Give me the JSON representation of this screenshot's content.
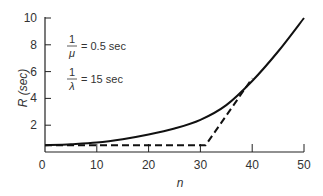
{
  "chart_data": {
    "type": "line",
    "title": "",
    "xlabel": "n",
    "ylabel": "R (sec)",
    "xlim": [
      0,
      50
    ],
    "ylim": [
      0,
      10
    ],
    "x_ticks": [
      "0",
      "10",
      "20",
      "30",
      "40",
      "50"
    ],
    "y_ticks": [
      "2",
      "4",
      "6",
      "8",
      "10"
    ],
    "grid": false,
    "legend": "none",
    "annotations": [
      {
        "num": "1",
        "den": "μ",
        "value": "= 0.5 sec"
      },
      {
        "num": "1",
        "den": "λ",
        "value": "= 15 sec"
      }
    ],
    "series": [
      {
        "name": "Response time (exact)",
        "style": "solid",
        "x": [
          0,
          5,
          10,
          15,
          20,
          25,
          30,
          35,
          40,
          45,
          50
        ],
        "y": [
          0.5,
          0.58,
          0.7,
          0.95,
          1.3,
          1.75,
          2.4,
          3.5,
          5.3,
          7.5,
          10
        ]
      },
      {
        "name": "Asymptotes",
        "style": "dashed",
        "x": [
          0,
          31,
          40
        ],
        "y": [
          0.5,
          0.5,
          5.5
        ]
      }
    ]
  }
}
